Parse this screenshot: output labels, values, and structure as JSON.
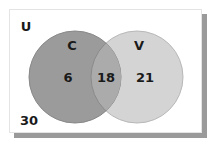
{
  "diagram": {
    "type": "venn",
    "universe": {
      "label": "U",
      "outside_value": "30"
    },
    "sets": [
      {
        "label": "C",
        "only_value": "6",
        "color": "#9b9b9b"
      },
      {
        "label": "V",
        "only_value": "21",
        "color": "#d4d4d4"
      }
    ],
    "intersection_value": "18",
    "intersection_color": "#a9a9a9",
    "frame_shadow_color": "#9a9a9a"
  }
}
